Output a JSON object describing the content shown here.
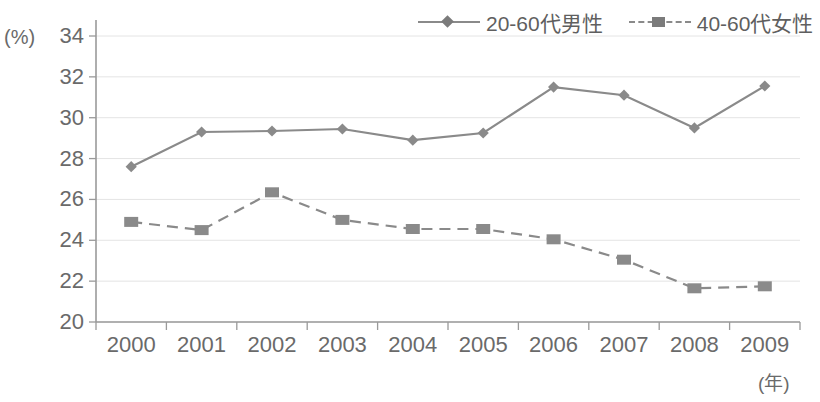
{
  "chart_data": {
    "type": "line",
    "title": "",
    "xlabel": "(年)",
    "ylabel": "(%)",
    "categories": [
      "2000",
      "2001",
      "2002",
      "2003",
      "2004",
      "2005",
      "2006",
      "2007",
      "2008",
      "2009"
    ],
    "ylim": [
      20,
      34
    ],
    "ytick_step": 2,
    "yticks": [
      "34",
      "32",
      "30",
      "28",
      "26",
      "24",
      "22",
      "20"
    ],
    "grid": true,
    "legend_position": "top-right",
    "series": [
      {
        "name": "20-60代男性",
        "marker": "diamond",
        "linestyle": "solid",
        "color": "#8a8a8a",
        "values": [
          27.6,
          29.3,
          29.35,
          29.45,
          28.9,
          29.25,
          31.5,
          31.1,
          29.5,
          31.55
        ]
      },
      {
        "name": "40-60代女性",
        "marker": "square",
        "linestyle": "dashed",
        "color": "#8a8a8a",
        "values": [
          24.9,
          24.5,
          26.35,
          25.0,
          24.55,
          24.55,
          24.05,
          23.05,
          21.65,
          21.75
        ]
      }
    ]
  },
  "legend": {
    "items": [
      {
        "label": "20-60代男性",
        "marker": "diamond-marker-icon",
        "style": "solid"
      },
      {
        "label": "40-60代女性",
        "marker": "square-marker-icon",
        "style": "dashed"
      }
    ]
  },
  "axes": {
    "y_unit": "(%)",
    "x_unit": "(年)"
  },
  "colors": {
    "series": "#8a8a8a",
    "axis": "#9a9a9a",
    "grid": "#e4e4e4",
    "text": "#6a6a6a"
  }
}
